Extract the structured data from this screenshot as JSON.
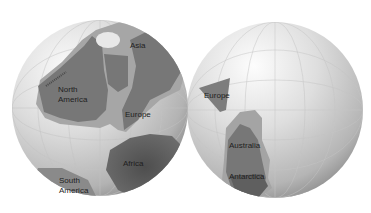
{
  "image": {
    "description": "Two globes showing ancient continental positions",
    "colors": {
      "background": "#ffffff",
      "ocean_light": "#efefef",
      "ocean_dark": "#9a9a9a",
      "land": "#7a7a7a",
      "shelf": "#a8a8a8",
      "africa": "#5e5e5e",
      "label": "#1e1e1e"
    }
  },
  "left_globe": {
    "labels": {
      "asia": "Asia",
      "north_america": "North",
      "north_america_2": "America",
      "europe": "Europe",
      "africa": "Africa",
      "south_america": "South",
      "south_america_2": "America"
    }
  },
  "right_globe": {
    "labels": {
      "europe": "Europe",
      "australia": "Australia",
      "antarctica": "Antarctica"
    }
  }
}
